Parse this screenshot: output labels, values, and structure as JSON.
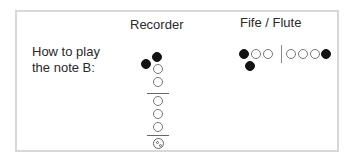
{
  "headers": {
    "recorder": "Recorder",
    "fife_flute": "Fife / Flute"
  },
  "prompt": {
    "line1": "How to play",
    "line2": "the note B:"
  },
  "colors": {
    "closed_hole": "#141414",
    "open_hole_border": "#777777",
    "frame_border": "#d8d8d8"
  },
  "recorder_fingering": {
    "thumb_hole": "closed",
    "left_hand": [
      "closed",
      "open",
      "open"
    ],
    "right_hand": [
      "open",
      "open",
      "open"
    ],
    "bell": "open"
  },
  "fife_fingering": {
    "left_hand": [
      "closed",
      "open",
      "open"
    ],
    "thumb": "closed",
    "right_hand": [
      "open",
      "open",
      "open"
    ],
    "pinky_key": "closed"
  }
}
